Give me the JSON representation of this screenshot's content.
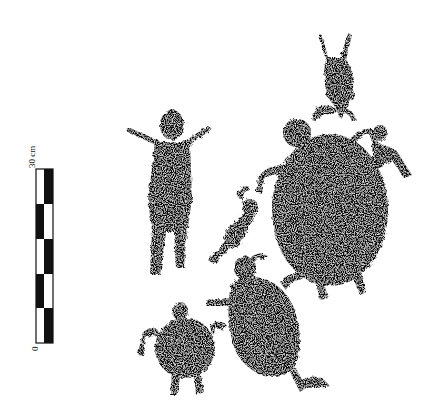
{
  "figure": {
    "scale_bar": {
      "top_label": "30 cm",
      "bottom_label": "0",
      "segments": 5
    },
    "figures": [
      {
        "name": "anthropomorph",
        "kind": "human figure with raised arms"
      },
      {
        "name": "quadruped-top",
        "kind": "small lizard/animal figure"
      },
      {
        "name": "large-turtle",
        "kind": "turtle"
      },
      {
        "name": "small-figure-left",
        "kind": "small human/lizard figure"
      },
      {
        "name": "small-figure-right",
        "kind": "small lizard figure"
      },
      {
        "name": "medium-turtle",
        "kind": "turtle"
      },
      {
        "name": "small-turtle",
        "kind": "turtle"
      }
    ],
    "colors": {
      "ink": "#111111",
      "paper": "#ffffff"
    }
  }
}
